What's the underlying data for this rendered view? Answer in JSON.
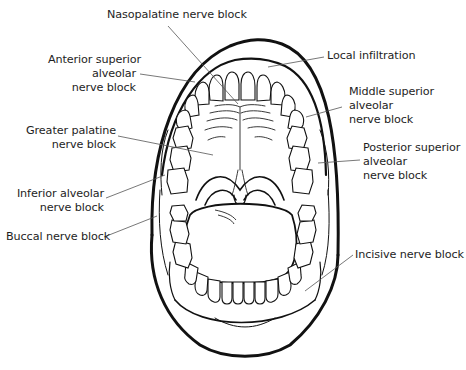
{
  "figure": {
    "labels": {
      "nasopalatine": {
        "lines": [
          "Nasopalatine nerve block"
        ]
      },
      "anterior_superior_alveolar": {
        "lines": [
          "Anterior superior",
          "alveolar",
          "nerve block"
        ]
      },
      "local_infiltration": {
        "lines": [
          "Local infiltration"
        ]
      },
      "middle_superior_alveolar": {
        "lines": [
          "Middle superior",
          "alveolar",
          "nerve block"
        ]
      },
      "greater_palatine": {
        "lines": [
          "Greater palatine",
          "nerve block"
        ]
      },
      "posterior_superior_alveolar": {
        "lines": [
          "Posterior superior",
          "alveolar",
          "nerve block"
        ]
      },
      "inferior_alveolar": {
        "lines": [
          "Inferior alveolar",
          "nerve block"
        ]
      },
      "buccal": {
        "lines": [
          "Buccal nerve block"
        ]
      },
      "incisive": {
        "lines": [
          "Incisive nerve block"
        ]
      }
    },
    "colors": {
      "ink": "#111111",
      "leader": "#555555",
      "text": "#1e1e1e",
      "background": "#ffffff"
    }
  }
}
